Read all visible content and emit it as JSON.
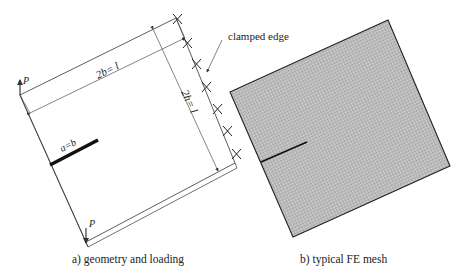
{
  "panel_a": {
    "caption": "a) geometry and loading",
    "width_label": "2b= l",
    "height_label": "2h= l",
    "crack_label": "a=b",
    "load_label_top": "P",
    "load_label_bottom": "P",
    "boundary_label": "clamped edge",
    "clamp_marker_count": 7
  },
  "panel_b": {
    "caption": "b) typical FE mesh"
  },
  "colors": {
    "line": "#333333",
    "mesh_fill": "#bdbdbd",
    "mesh_grid": "#8a8a8a",
    "crack": "#111111"
  }
}
